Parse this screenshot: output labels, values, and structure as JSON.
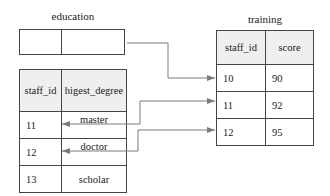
{
  "education": {
    "title": "education",
    "headers": [
      "staff_id",
      "higest_degree"
    ],
    "rows": [
      [
        "11",
        "master"
      ],
      [
        "12",
        "doctor"
      ],
      [
        "13",
        "scholar"
      ]
    ]
  },
  "training": {
    "title": "training",
    "headers": [
      "staff_id",
      "score"
    ],
    "rows": [
      [
        "10",
        "90"
      ],
      [
        "11",
        "92"
      ],
      [
        "12",
        "95"
      ]
    ]
  },
  "colors": {
    "line": "#7a7a7a",
    "border": "#444444",
    "header_bg": "#efefef"
  }
}
